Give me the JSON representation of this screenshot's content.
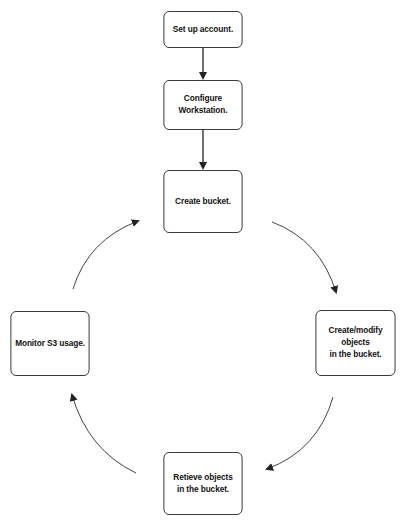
{
  "diagram": {
    "type": "flowchart-cycle",
    "nodes": [
      {
        "id": "setup",
        "label": "Set up account."
      },
      {
        "id": "configure",
        "label": "Configure\nWorkstation."
      },
      {
        "id": "create_bucket",
        "label": "Create bucket."
      },
      {
        "id": "create_modify",
        "label": "Create/modify\nobjects\nin the bucket."
      },
      {
        "id": "retrieve",
        "label": "Retieve objects\nin the bucket."
      },
      {
        "id": "monitor",
        "label": "Monitor S3 usage."
      }
    ],
    "edges": [
      {
        "from": "setup",
        "to": "configure",
        "style": "straight"
      },
      {
        "from": "configure",
        "to": "create_bucket",
        "style": "straight"
      },
      {
        "from": "create_bucket",
        "to": "create_modify",
        "style": "curved"
      },
      {
        "from": "create_modify",
        "to": "retrieve",
        "style": "curved"
      },
      {
        "from": "retrieve",
        "to": "monitor",
        "style": "curved"
      },
      {
        "from": "monitor",
        "to": "create_bucket",
        "style": "curved"
      }
    ],
    "colors": {
      "stroke": "#333333",
      "text": "#111111",
      "background": "#ffffff"
    }
  }
}
